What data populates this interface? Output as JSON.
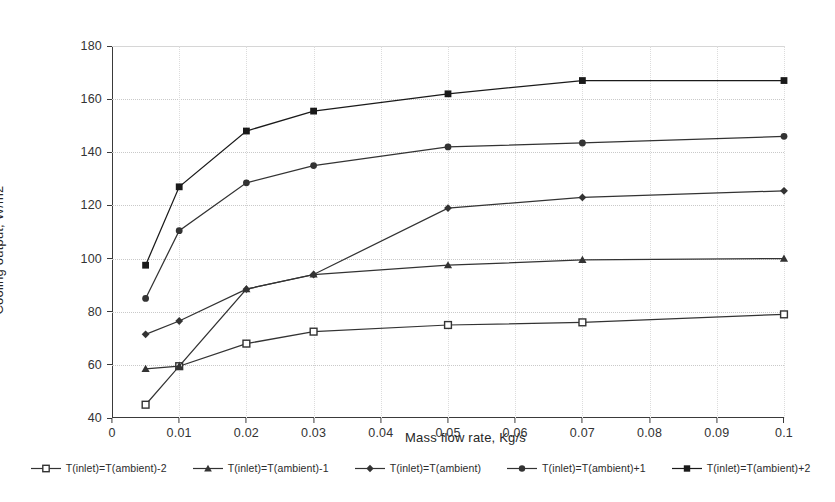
{
  "chart_data": {
    "type": "line",
    "title": "",
    "xlabel": "Mass flow rate, Kg/s",
    "ylabel": "Cooling output, W/m2",
    "xlim": [
      0,
      0.1
    ],
    "ylim": [
      40,
      180
    ],
    "xticks": [
      "0",
      "0.01",
      "0.02",
      "0.03",
      "0.04",
      "0.05",
      "0.06",
      "0.07",
      "0.08",
      "0.09",
      "0.1"
    ],
    "xtick_values": [
      0,
      0.01,
      0.02,
      0.03,
      0.04,
      0.05,
      0.06,
      0.07,
      0.08,
      0.09,
      0.1
    ],
    "yticks": [
      "40",
      "60",
      "80",
      "100",
      "120",
      "140",
      "160",
      "180"
    ],
    "ytick_values": [
      40,
      60,
      80,
      100,
      120,
      140,
      160,
      180
    ],
    "grid": true,
    "legend_position": "bottom",
    "x": [
      0.005,
      0.01,
      0.02,
      0.03,
      0.05,
      0.07,
      0.1
    ],
    "series": [
      {
        "name": "T(inlet)=T(ambient)-2",
        "marker": "square-open",
        "color": "#333333",
        "values": [
          45,
          59.5,
          68,
          72.5,
          75,
          76,
          79
        ]
      },
      {
        "name": "T(inlet)=T(ambient)-1",
        "marker": "triangle",
        "color": "#333333",
        "values": [
          58.5,
          59.5,
          88.5,
          94,
          97.5,
          99.5,
          100
        ]
      },
      {
        "name": "T(inlet)=T(ambient)",
        "marker": "diamond",
        "color": "#333333",
        "values": [
          71.5,
          76.5,
          88.5,
          94,
          119,
          123,
          125.5
        ]
      },
      {
        "name": "T(inlet)=T(ambient)+1",
        "marker": "circle",
        "color": "#333333",
        "values": [
          85,
          110.5,
          128.5,
          135,
          142,
          143.5,
          146
        ]
      },
      {
        "name": "T(inlet)=T(ambient)+2",
        "marker": "square-filled",
        "color": "#1a1a1a",
        "values": [
          97.5,
          127,
          148,
          155.5,
          162,
          167,
          167
        ]
      }
    ]
  }
}
